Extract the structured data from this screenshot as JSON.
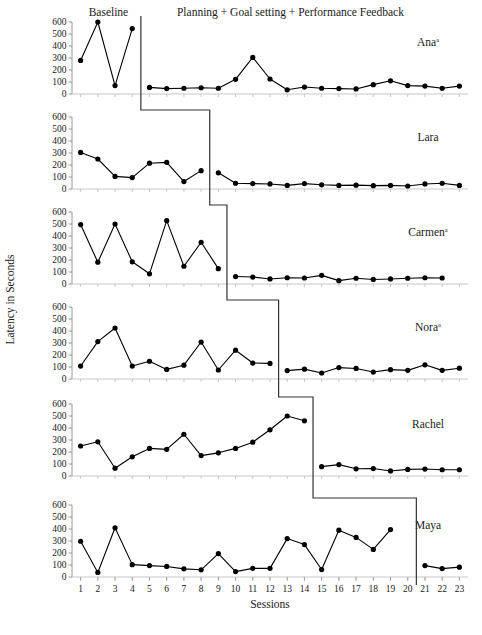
{
  "figure": {
    "ylabel": "Latency in Seconds",
    "xlabel": "Sessions",
    "phase_labels": {
      "baseline": "Baseline",
      "intervention": "Planning + Goal setting + Performance Feedback"
    },
    "series_marker_color": "#000000",
    "line_color": "#000000",
    "axis_color": "#808080",
    "phase_line_color": "#333333"
  },
  "chart_data": {
    "type": "line",
    "title": "",
    "subtitle": "",
    "xlabel": "Sessions",
    "ylabel": "Latency in Seconds",
    "ylim": [
      0,
      600
    ],
    "yticks": [
      0,
      100,
      200,
      300,
      400,
      500,
      600
    ],
    "xlim": [
      0.5,
      23.5
    ],
    "xticks": [
      1,
      2,
      3,
      4,
      5,
      6,
      7,
      8,
      9,
      10,
      11,
      12,
      13,
      14,
      15,
      16,
      17,
      18,
      19,
      20,
      21,
      22,
      23
    ],
    "xtick_labels": [
      "1",
      "2",
      "3",
      "4",
      "5",
      "6",
      "7",
      "8",
      "9",
      "10",
      "11",
      "12",
      "13",
      "14",
      "15",
      "16",
      "17",
      "18",
      "19",
      "20",
      "21",
      "22",
      "23"
    ],
    "grid": false,
    "legend": "none",
    "annotations": [
      "Baseline",
      "Planning + Goal setting + Performance Feedback"
    ],
    "panels": [
      {
        "name": "Ana",
        "superscript": "a",
        "phase_change_x": 4.5,
        "baseline": {
          "x": [
            1,
            2,
            3,
            4
          ],
          "y": [
            280,
            600,
            70,
            545
          ]
        },
        "intervention": {
          "x": [
            5,
            6,
            7,
            8,
            9,
            10,
            11,
            12,
            13,
            14,
            15,
            16,
            17,
            18,
            19,
            20,
            21,
            22,
            23
          ],
          "y": [
            55,
            45,
            48,
            52,
            48,
            122,
            305,
            125,
            35,
            58,
            48,
            45,
            42,
            78,
            110,
            70,
            66,
            48,
            66
          ]
        }
      },
      {
        "name": "Lara",
        "superscript": "",
        "phase_change_x": 8.5,
        "baseline": {
          "x": [
            1,
            2,
            3,
            4,
            5,
            6,
            7,
            8
          ],
          "y": [
            305,
            250,
            105,
            95,
            215,
            222,
            62,
            153
          ]
        },
        "intervention": {
          "x": [
            9,
            10,
            11,
            12,
            13,
            14,
            15,
            16,
            17,
            18,
            19,
            20,
            21,
            22,
            23
          ],
          "y": [
            135,
            48,
            45,
            42,
            30,
            45,
            35,
            30,
            32,
            28,
            30,
            25,
            42,
            48,
            30
          ]
        }
      },
      {
        "name": "Carmen",
        "superscript": "a",
        "phase_change_x": 9.5,
        "baseline": {
          "x": [
            1,
            2,
            3,
            4,
            5,
            6,
            7,
            8,
            9
          ],
          "y": [
            495,
            182,
            500,
            185,
            85,
            528,
            148,
            348,
            128
          ]
        },
        "intervention": {
          "x": [
            10,
            11,
            12,
            13,
            14,
            15,
            16,
            17,
            18,
            19,
            20,
            21,
            22
          ],
          "y": [
            62,
            58,
            42,
            52,
            50,
            72,
            28,
            48,
            38,
            42,
            48,
            52,
            50
          ]
        }
      },
      {
        "name": "Nora",
        "superscript": "a",
        "phase_change_x": 12.5,
        "baseline": {
          "x": [
            1,
            2,
            3,
            4,
            5,
            6,
            7,
            8,
            9,
            10,
            11,
            12
          ],
          "y": [
            108,
            312,
            425,
            108,
            148,
            80,
            115,
            308,
            75,
            240,
            133,
            130
          ]
        },
        "intervention": {
          "x": [
            13,
            14,
            15,
            16,
            17,
            18,
            19,
            20,
            21,
            22,
            23
          ],
          "y": [
            70,
            82,
            50,
            95,
            88,
            58,
            78,
            72,
            118,
            72,
            90
          ]
        }
      },
      {
        "name": "Rachel",
        "superscript": "",
        "phase_change_x": 14.5,
        "baseline": {
          "x": [
            1,
            2,
            3,
            4,
            5,
            6,
            7,
            8,
            9,
            10,
            11,
            12,
            13,
            14
          ],
          "y": [
            250,
            285,
            65,
            160,
            230,
            222,
            348,
            170,
            193,
            230,
            282,
            385,
            500,
            460
          ]
        },
        "intervention": {
          "x": [
            15,
            16,
            17,
            18,
            19,
            20,
            21,
            22,
            23
          ],
          "y": [
            78,
            95,
            60,
            62,
            42,
            55,
            58,
            52,
            52
          ]
        }
      },
      {
        "name": "Maya",
        "superscript": "",
        "phase_change_x": 20.5,
        "baseline": {
          "x": [
            1,
            2,
            3,
            4,
            5,
            6,
            7,
            8,
            9,
            10,
            11,
            12,
            13,
            14,
            15,
            16,
            17,
            18,
            19
          ],
          "y": [
            298,
            38,
            410,
            103,
            95,
            88,
            68,
            60,
            195,
            45,
            72,
            72,
            320,
            270,
            62,
            390,
            330,
            230,
            395
          ]
        },
        "intervention": {
          "x": [
            21,
            22,
            23
          ],
          "y": [
            95,
            70,
            82
          ]
        }
      }
    ]
  }
}
